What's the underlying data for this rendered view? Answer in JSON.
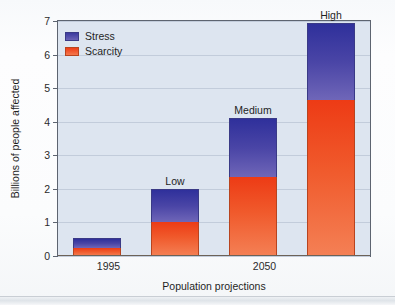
{
  "chart_data": {
    "type": "bar",
    "subtype": "stacked-bar",
    "title": "",
    "xlabel": "Population projections",
    "ylabel": "Billions of people affected",
    "ylim": [
      0,
      7
    ],
    "ytick_labels": [
      "0",
      "1",
      "2",
      "3",
      "4",
      "5",
      "6",
      "7"
    ],
    "ytick_values": [
      0,
      1,
      2,
      3,
      4,
      5,
      6,
      7
    ],
    "grid": true,
    "grid_axis": "y",
    "legend_position": "upper-left",
    "categories": [
      "1995",
      "Low",
      "Medium",
      "High"
    ],
    "xtick_labels": [
      "1995",
      "2050"
    ],
    "bar_annotations": [
      "",
      "Low",
      "Medium",
      "High"
    ],
    "series": [
      {
        "name": "Scarcity",
        "color": "#f0522a",
        "values": [
          0.25,
          1.0,
          2.35,
          4.65
        ]
      },
      {
        "name": "Stress",
        "color": "#4a45a6",
        "values": [
          0.3,
          1.0,
          1.75,
          2.3
        ]
      }
    ],
    "totals": [
      0.55,
      2.0,
      4.1,
      6.95
    ]
  },
  "legend": {
    "items": [
      {
        "label": "Stress",
        "color": "#4a45a6"
      },
      {
        "label": "Scarcity",
        "color": "#f0522a"
      }
    ]
  },
  "axes": {
    "y_title": "Billions of people affected",
    "x_title": "Population projections",
    "y_ticks": [
      "7",
      "6",
      "5",
      "4",
      "3",
      "2",
      "1",
      "0"
    ],
    "x_ticks": [
      {
        "label": "1995",
        "position_pct": 16.5
      },
      {
        "label": "2050",
        "position_pct": 66.5
      }
    ]
  },
  "bars": [
    {
      "name": "1995",
      "annotation": "",
      "scarcity": 0.25,
      "stress": 0.3,
      "total": 0.55
    },
    {
      "name": "Low",
      "annotation": "Low",
      "scarcity": 1.0,
      "stress": 1.0,
      "total": 2.0
    },
    {
      "name": "Medium",
      "annotation": "Medium",
      "scarcity": 2.35,
      "stress": 1.75,
      "total": 4.1
    },
    {
      "name": "High",
      "annotation": "High",
      "scarcity": 4.65,
      "stress": 2.3,
      "total": 6.95
    }
  ],
  "colors": {
    "plot_background": "#dde5f0",
    "page_background": "#fbfcfd",
    "gridline": "#c2ccdb",
    "frame": "#5d6470",
    "stress": "#4a45a6",
    "scarcity": "#f0522a"
  }
}
